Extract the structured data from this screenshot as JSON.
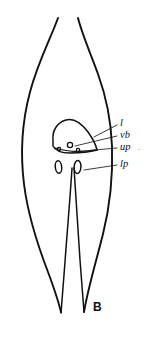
{
  "figure": {
    "panel_label": "B",
    "caption_marker": ".",
    "background_color": "#ffffff",
    "stroke_color": "#111111",
    "width": 147,
    "height": 343
  },
  "labels": [
    {
      "id": "l",
      "text": "l",
      "meaning": "lumen",
      "text_x": 120,
      "text_y": 124,
      "leader_x1": 94,
      "leader_y1": 137,
      "leader_x2": 117,
      "leader_y2": 125
    },
    {
      "id": "vb",
      "text": "vb",
      "meaning": "ventral body",
      "text_x": 120,
      "text_y": 136,
      "leader_x1": 75,
      "leader_y1": 146,
      "leader_x2": 117,
      "leader_y2": 136
    },
    {
      "id": "up",
      "text": "up",
      "meaning": "upper pore",
      "text_x": 120,
      "text_y": 148,
      "leader_x1": 72,
      "leader_y1": 152,
      "leader_x2": 117,
      "leader_y2": 148
    },
    {
      "id": "lp",
      "text": "lp",
      "meaning": "lower pore",
      "text_x": 120,
      "text_y": 165,
      "leader_x1": 84,
      "leader_y1": 170,
      "leader_x2": 117,
      "leader_y2": 165
    }
  ],
  "shapes": {
    "body_outline_left": "M 58,18 C 50,40 38,62 30,92 C 22,122 20,152 24,184 C 28,216 38,246 48,272 C 54,288 58,300 61,312",
    "body_outline_right": "M 78,18 C 82,34 90,52 98,74 C 106,96 111,120 112,146 C 113,176 110,206 103,234 C 96,262 88,288 84,312",
    "median_line": "M 72,168 C 70,200 67,234 65,262 C 63,286 62,300 61,313",
    "median_line2": "M 74,168 C 76,200 78,232 80,260 C 82,284 83,300 84,312",
    "organ_body": "M 53,140 C 52,130 58,122 66,120 C 74,118 82,124 88,132 C 93,139 96,145 97,150 C 90,152 80,153 70,153 C 61,153 55,150 53,146 Z",
    "organ_inner_line": "M 55,148 C 64,151 76,152 88,151 C 92,150 95,150 97,150",
    "ventral_body_circle": {
      "cx": 70,
      "cy": 145,
      "r": 2.6
    },
    "pore_left_circle": {
      "cx": 59,
      "cy": 149,
      "r": 1.7
    },
    "pore_right_circle": {
      "cx": 78,
      "cy": 150,
      "r": 1.7
    },
    "lower_pore_left": {
      "cx": 58.5,
      "cy": 167,
      "rx": 3.2,
      "ry": 6.2,
      "rot": -6
    },
    "lower_pore_right": {
      "cx": 77.5,
      "cy": 167,
      "rx": 3.4,
      "ry": 6.6,
      "rot": 4
    }
  },
  "panel": {
    "label_x": 93,
    "label_y": 311
  },
  "stray_dot": {
    "x": 138,
    "y": 150,
    "glyph": "."
  }
}
